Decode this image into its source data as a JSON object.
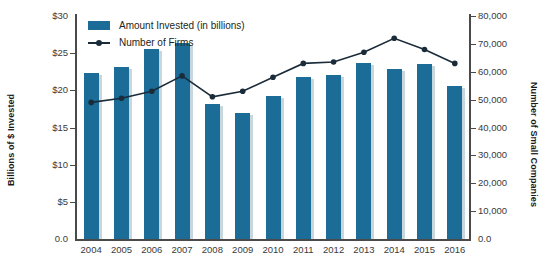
{
  "chart_data": {
    "type": "bar",
    "title": "",
    "xlabel": "",
    "ylabel": "Billions of $ Invested",
    "y2label": "Number of Small Companies",
    "categories": [
      "2004",
      "2005",
      "2006",
      "2007",
      "2008",
      "2009",
      "2010",
      "2011",
      "2012",
      "2013",
      "2014",
      "2015",
      "2016"
    ],
    "ylim": [
      0,
      30
    ],
    "y2lim": [
      0,
      80000
    ],
    "grid": false,
    "legend_position": "top-left",
    "series": [
      {
        "name": "Amount Invested (in billions)",
        "type": "bar",
        "axis": "left",
        "color": "#1b6d97",
        "values": [
          22.4,
          23.1,
          25.6,
          26.4,
          18.2,
          16.9,
          19.3,
          21.8,
          22.1,
          23.7,
          22.9,
          23.6,
          20.6
        ]
      },
      {
        "name": "Number of Firms",
        "type": "line",
        "axis": "right",
        "color": "#1a2b3a",
        "values": [
          49000,
          50500,
          53000,
          58500,
          51000,
          53000,
          58000,
          63000,
          63500,
          67000,
          72000,
          68000,
          63000
        ]
      }
    ],
    "y_ticks": [
      "$30",
      "$25",
      "$20",
      "$15",
      "$10",
      "$5",
      "0.0"
    ],
    "y_tick_values": [
      30,
      25,
      20,
      15,
      10,
      5,
      0
    ],
    "y2_ticks": [
      "80,000",
      "70,000",
      "60,000",
      "50,000",
      "40,000",
      "30,000",
      "20,000",
      "10,000",
      "0.0"
    ],
    "y2_tick_values": [
      80000,
      70000,
      60000,
      50000,
      40000,
      30000,
      20000,
      10000,
      0
    ]
  },
  "legend": {
    "items": [
      {
        "label": "Amount Invested (in billions)",
        "marker": "square-swatch"
      },
      {
        "label": "Number of Firms",
        "marker": "line-with-dot"
      }
    ]
  },
  "axes": {
    "left_title": "Billions of $ Invested",
    "right_title": "Number of Small Companies"
  }
}
